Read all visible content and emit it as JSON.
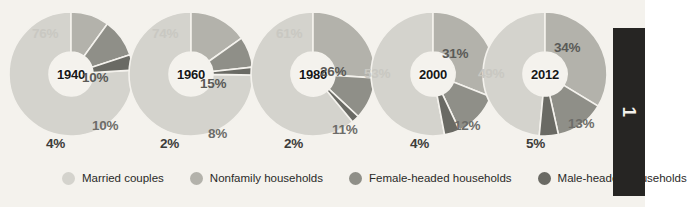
{
  "chart_data": {
    "type": "pie",
    "title": "",
    "xlabel": "",
    "ylabel": "",
    "legend_position": "bottom",
    "categories": [
      "Married couples",
      "Nonfamily households",
      "Female-headed households",
      "Male-headed households"
    ],
    "colors": [
      "#d4d3cd",
      "#b3b2ab",
      "#8f8f88",
      "#6a6a64"
    ],
    "charts": [
      {
        "year": "1940",
        "values": [
          76,
          10,
          10,
          4
        ],
        "labels": [
          "76%",
          "10%",
          "10%",
          "4%"
        ]
      },
      {
        "year": "1960",
        "values": [
          74,
          15,
          8,
          2
        ],
        "labels": [
          "74%",
          "15%",
          "8%",
          "2%"
        ]
      },
      {
        "year": "1980",
        "values": [
          61,
          26,
          11,
          2
        ],
        "labels": [
          "61%",
          "26%",
          "11%",
          "2%"
        ]
      },
      {
        "year": "2000",
        "values": [
          53,
          31,
          12,
          4
        ],
        "labels": [
          "53%",
          "31%",
          "12%",
          "4%"
        ]
      },
      {
        "year": "2012",
        "values": [
          49,
          34,
          13,
          5
        ],
        "labels": [
          "49%",
          "34%",
          "13%",
          "5%"
        ]
      }
    ]
  },
  "legend": {
    "items": [
      {
        "label": "Married couples",
        "color": "#d4d3cd"
      },
      {
        "label": "Nonfamily households",
        "color": "#b3b2ab"
      },
      {
        "label": "Female-headed households",
        "color": "#8f8f88"
      },
      {
        "label": "Male-headed households",
        "color": "#6a6a64"
      }
    ]
  },
  "side_panel": {
    "text": "1"
  }
}
